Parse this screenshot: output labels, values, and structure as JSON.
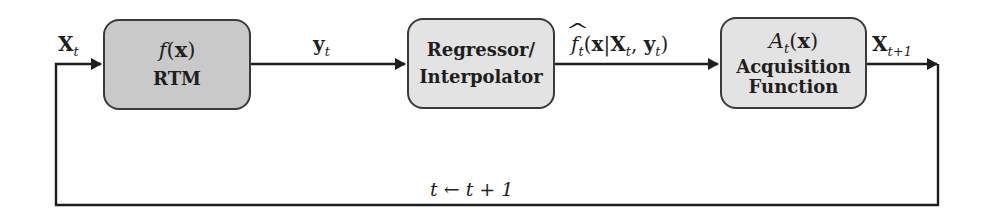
{
  "diagram": {
    "type": "feedback-loop-flowchart",
    "colors": {
      "line": "#1e1e1e",
      "box_border": "#3a3a3a",
      "rtm_fill": "#c9c9c9",
      "block_fill": "#e3e3e3"
    },
    "blocks": [
      {
        "id": "rtm",
        "math_fn": "f",
        "math_arg": "x",
        "text_lines": [
          "RTM"
        ]
      },
      {
        "id": "regressor",
        "math_fn": "",
        "math_arg": "",
        "text_lines": [
          "Regressor/",
          "Interpolator"
        ]
      },
      {
        "id": "acquisition",
        "math_fn": "A",
        "math_sub": "t",
        "math_arg": "x",
        "text_lines": [
          "Acquisition",
          "Function"
        ]
      }
    ],
    "edges": [
      {
        "from": "loop",
        "to": "rtm",
        "label_base": "X",
        "label_sub": "t"
      },
      {
        "from": "rtm",
        "to": "regressor",
        "label_base": "y",
        "label_sub": "t"
      },
      {
        "from": "regressor",
        "to": "acquisition",
        "label_fn": "f",
        "label_fn_sub": "t",
        "label_hat": "^",
        "label_x": "x",
        "label_bar": "|",
        "label_X": "X",
        "label_X_sub": "t",
        "label_comma": ",",
        "label_y": "y",
        "label_y_sub": "t"
      },
      {
        "from": "acquisition",
        "to": "loop",
        "label_base": "X",
        "label_sub": "t+1"
      }
    ],
    "feedback": {
      "label": "t ← t + 1"
    }
  }
}
